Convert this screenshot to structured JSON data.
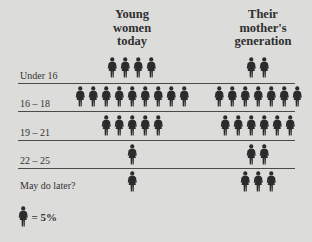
{
  "chart_data": {
    "type": "pictogram",
    "title": "",
    "categories": [
      "Under 16",
      "16 – 18",
      "19 – 21",
      "22 – 25",
      "May do later?"
    ],
    "series": [
      {
        "name": "Young women today",
        "icons": [
          4,
          9,
          5,
          1,
          1
        ],
        "values_pct": [
          20,
          45,
          25,
          5,
          5
        ]
      },
      {
        "name": "Their mother's generation",
        "icons": [
          2,
          7,
          6,
          2,
          3
        ],
        "values_pct": [
          10,
          35,
          30,
          10,
          15
        ]
      }
    ],
    "unit": "1 figure = 5%",
    "legend_position": "bottom-left"
  },
  "headers": {
    "young": [
      "Young",
      "women",
      "today"
    ],
    "mothers": [
      "Their",
      "mother's",
      "generation"
    ]
  },
  "rows": [
    {
      "label": "Under 16",
      "young": 4,
      "mothers": 2
    },
    {
      "label": "16 – 18",
      "young": 9,
      "mothers": 7
    },
    {
      "label": "19 – 21",
      "young": 5,
      "mothers": 6
    },
    {
      "label": "22 – 25",
      "young": 1,
      "mothers": 2
    },
    {
      "label": "May do later?",
      "young": 1,
      "mothers": 3
    }
  ],
  "legend": {
    "text": "= 5%"
  },
  "colors": {
    "background": "#dcdcda",
    "figure": "#2b2b2b",
    "rule": "#4a4a4a"
  }
}
